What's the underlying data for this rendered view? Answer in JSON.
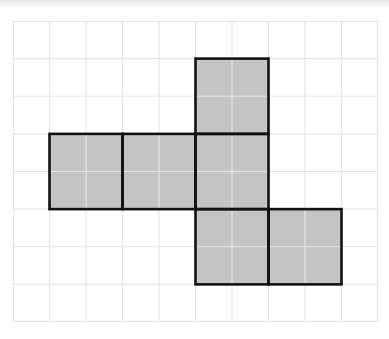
{
  "diagram": {
    "type": "grid-net",
    "grid": {
      "columns": 10,
      "rows": 8,
      "line_color": "#e6e6e6",
      "background": "#ffffff"
    },
    "square_size_in_cells": 2,
    "fill_color": "#c4c4c4",
    "outline_color": "#111111",
    "squares": [
      {
        "id": "top",
        "col": 5,
        "row": 1
      },
      {
        "id": "middle-left",
        "col": 1,
        "row": 3
      },
      {
        "id": "middle-center",
        "col": 3,
        "row": 3
      },
      {
        "id": "middle-right",
        "col": 5,
        "row": 3
      },
      {
        "id": "bottom-left",
        "col": 5,
        "row": 5
      },
      {
        "id": "bottom-right",
        "col": 7,
        "row": 5
      }
    ]
  }
}
